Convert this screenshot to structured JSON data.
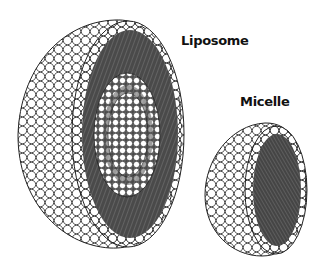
{
  "labels": {
    "liposome": "Liposome",
    "micelle": "Micelle"
  },
  "colors": {
    "background": "#ffffff",
    "head_fill": "#ffffff",
    "head_stroke": "#222222",
    "tail_band": "#4a4a4a",
    "tail_line": "#777777",
    "label_text": "#111111"
  },
  "structures": [
    {
      "name": "liposome",
      "description": "Cut-away half sphere of lipid bilayer with phospholipid heads (white circles) and hydrophobic tails (dark band) enclosing an aqueous cavity"
    },
    {
      "name": "micelle",
      "description": "Cut-away half sphere of single lipid layer with heads outward and tails pointing to the core"
    }
  ]
}
